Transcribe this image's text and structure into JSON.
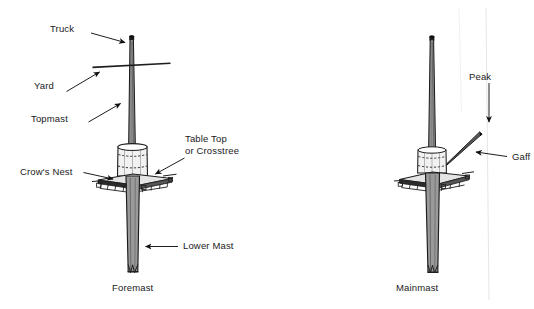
{
  "figure": {
    "background_color": "#ffffff",
    "ink_color": "#1a1a1a",
    "width": 534,
    "height": 309
  },
  "diagrams": [
    {
      "id": "foremast",
      "caption": "Foremast",
      "labels": [
        {
          "key": "truck",
          "text": "Truck"
        },
        {
          "key": "yard",
          "text": "Yard"
        },
        {
          "key": "topmast",
          "text": "Topmast"
        },
        {
          "key": "table_top",
          "text": "Table Top"
        },
        {
          "key": "crosstree",
          "text": "or Crosstree"
        },
        {
          "key": "crows_nest",
          "text": "Crow's Nest"
        },
        {
          "key": "lower_mast",
          "text": "Lower Mast"
        }
      ]
    },
    {
      "id": "mainmast",
      "caption": "Mainmast",
      "labels": [
        {
          "key": "peak",
          "text": "Peak"
        },
        {
          "key": "gaff",
          "text": "Gaff"
        }
      ]
    }
  ],
  "labels": {
    "truck": "Truck",
    "yard": "Yard",
    "topmast": "Topmast",
    "table_top_line1": "Table Top",
    "table_top_line2": "or Crosstree",
    "crows_nest": "Crow's Nest",
    "lower_mast": "Lower Mast",
    "foremast": "Foremast",
    "peak": "Peak",
    "gaff": "Gaff",
    "mainmast": "Mainmast"
  }
}
